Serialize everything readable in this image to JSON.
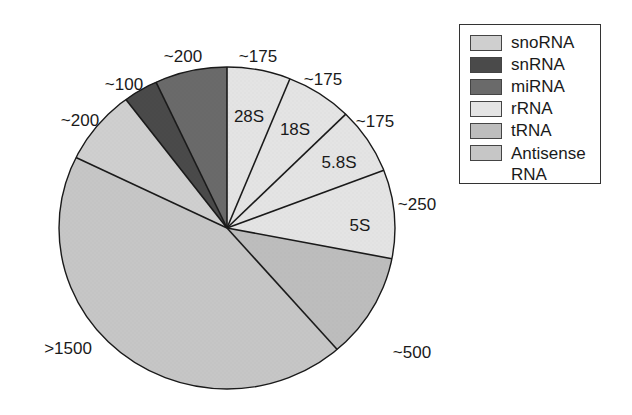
{
  "chart_data": {
    "type": "pie",
    "title": "",
    "legend": {
      "position": "upper-right",
      "entries": [
        {
          "label": "snoRNA",
          "color": "#cfcfcf"
        },
        {
          "label": "snRNA",
          "color": "#4a4a4a"
        },
        {
          "label": "miRNA",
          "color": "#6a6a6a"
        },
        {
          "label": "rRNA",
          "color": "#e4e4e4"
        },
        {
          "label": "tRNA",
          "color": "#bdbdbd"
        },
        {
          "label": "Antisense RNA",
          "color": "#c6c6c6"
        }
      ]
    },
    "slices": [
      {
        "category": "rRNA",
        "sublabel": "28S",
        "value_label": "~175",
        "value": 175,
        "start_deg": 0,
        "end_deg": 22,
        "color": "#e4e4e4"
      },
      {
        "category": "rRNA",
        "sublabel": "18S",
        "value_label": "~175",
        "value": 175,
        "start_deg": 22,
        "end_deg": 45,
        "color": "#e4e4e4"
      },
      {
        "category": "rRNA",
        "sublabel": "5.8S",
        "value_label": "~175",
        "value": 175,
        "start_deg": 45,
        "end_deg": 69,
        "color": "#e4e4e4"
      },
      {
        "category": "rRNA",
        "sublabel": "5S",
        "value_label": "~250",
        "value": 250,
        "start_deg": 69,
        "end_deg": 101,
        "color": "#e4e4e4"
      },
      {
        "category": "tRNA",
        "sublabel": "",
        "value_label": "~500",
        "value": 500,
        "start_deg": 101,
        "end_deg": 139,
        "color": "#bdbdbd"
      },
      {
        "category": "Antisense RNA",
        "sublabel": "",
        "value_label": ">1500",
        "value": 1500,
        "start_deg": 139,
        "end_deg": 296,
        "color": "#c6c6c6"
      },
      {
        "category": "snoRNA",
        "sublabel": "",
        "value_label": "~200",
        "value": 200,
        "start_deg": 296,
        "end_deg": 323,
        "color": "#cfcfcf"
      },
      {
        "category": "snRNA",
        "sublabel": "",
        "value_label": "~100",
        "value": 100,
        "start_deg": 323,
        "end_deg": 335,
        "color": "#4a4a4a"
      },
      {
        "category": "miRNA",
        "sublabel": "",
        "value_label": "~200",
        "value": 200,
        "start_deg": 335,
        "end_deg": 360,
        "color": "#6a6a6a"
      }
    ],
    "outer_labels": [
      {
        "text": "~175",
        "x": 258,
        "y": 57
      },
      {
        "text": "~175",
        "x": 323,
        "y": 80
      },
      {
        "text": "~175",
        "x": 375,
        "y": 122
      },
      {
        "text": "~250",
        "x": 417,
        "y": 205
      },
      {
        "text": "~500",
        "x": 412,
        "y": 353
      },
      {
        "text": ">1500",
        "x": 68,
        "y": 349
      },
      {
        "text": "~200",
        "x": 80,
        "y": 121
      },
      {
        "text": "~100",
        "x": 124,
        "y": 85
      },
      {
        "text": "~200",
        "x": 183,
        "y": 57
      }
    ],
    "inner_labels": [
      {
        "text": "28S",
        "x": 249,
        "y": 117
      },
      {
        "text": "18S",
        "x": 295,
        "y": 130
      },
      {
        "text": "5.8S",
        "x": 339,
        "y": 163
      },
      {
        "text": "5S",
        "x": 360,
        "y": 226
      }
    ],
    "geometry": {
      "cx": 227,
      "cy": 228,
      "rx": 168,
      "ry": 161
    }
  }
}
